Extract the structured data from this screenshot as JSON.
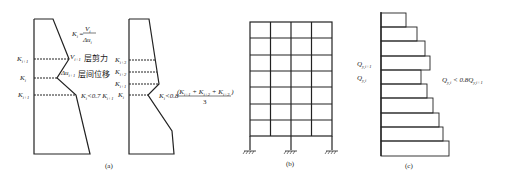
{
  "panel_a": {
    "caption": "(a)",
    "left": {
      "labels": {
        "k_i_plus_1": "K",
        "k_i_plus_1_sub": "i+1",
        "k_i": "K",
        "k_i_sub": "i",
        "k_i_minus_1": "K",
        "k_i_minus_1_sub": "i+1"
      },
      "formula_k": "K",
      "formula_k_sub": "i",
      "formula_eq": "=",
      "formula_num": "V",
      "formula_num_sub": "i",
      "formula_den": "Δu",
      "formula_den_sub": "i",
      "shear_symbol": "V",
      "shear_sub": "i+1",
      "shear_text": "层剪力",
      "drift_symbol": "Δu",
      "drift_sub": "i+1",
      "drift_text": "层间位移",
      "condition": "K",
      "condition_sub": "i",
      "condition_rest": "<0.7 K",
      "condition_rest_sub": "i+1"
    },
    "right": {
      "labels": {
        "k_i3": "K",
        "k_i3_sub": "i+3",
        "k_i2": "K",
        "k_i2_sub": "i+2",
        "k_i1": "K",
        "k_i1_sub": "i+1",
        "k_i": "K",
        "k_i_sub": "i"
      },
      "condition_lhs": "K",
      "condition_lhs_sub": "i",
      "condition_op": "<0.8",
      "condition_num": "(K",
      "condition_num_s1": "i+1",
      "condition_num_p1": " + K",
      "condition_num_s2": "i+2",
      "condition_num_p2": " + K",
      "condition_num_s3": "i+3",
      "condition_num_close": " )",
      "condition_den": "3"
    }
  },
  "panel_b": {
    "caption": "(b)",
    "stories": 7,
    "bays": 4
  },
  "panel_c": {
    "caption": "(c)",
    "label_upper": "Q",
    "label_upper_sub": "y,i+1",
    "label_lower": "Q",
    "label_lower_sub": "y,i",
    "condition_lhs": "Q",
    "condition_lhs_sub": "y,i",
    "condition_op": " < 0.8Q",
    "condition_rhs_sub": "y,i+1"
  }
}
